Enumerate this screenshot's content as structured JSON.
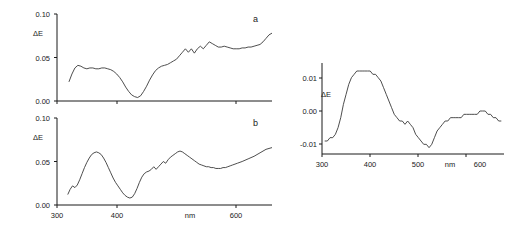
{
  "figure": {
    "background": "#ffffff",
    "line_color": "#3a3a3a",
    "axis_color": "#1a1a1a"
  },
  "panels": {
    "a": {
      "letter": "a",
      "y_axis_label": "ΔE",
      "x_axis_label": "nm",
      "y_ticks": [
        "0.10",
        "0.05",
        "0.00"
      ],
      "x_ticks": [
        "300",
        "400",
        "600"
      ]
    },
    "b": {
      "letter": "b",
      "y_axis_label": "ΔE",
      "x_axis_label": "nm",
      "y_ticks": [
        "0.10",
        "0.05",
        "0.00"
      ],
      "x_ticks": [
        "300",
        "400",
        "600"
      ]
    },
    "c": {
      "letter": "",
      "y_axis_label": "ΔE",
      "x_axis_label": "nm",
      "y_ticks": [
        "0.01",
        "0.00",
        "-0.01"
      ],
      "x_ticks": [
        "300",
        "400",
        "500",
        "600"
      ]
    }
  },
  "chart_data": [
    {
      "id": "panel-a",
      "type": "line",
      "title": "a",
      "xlabel": "nm",
      "ylabel": "ΔE",
      "xlim": [
        300,
        660
      ],
      "ylim": [
        0.0,
        0.1
      ],
      "xticks": [
        300,
        400,
        600
      ],
      "yticks": [
        0.0,
        0.05,
        0.1
      ],
      "grid": false,
      "legend": "none",
      "series": [
        {
          "name": "ΔE spectrum a",
          "x": [
            320,
            325,
            330,
            335,
            340,
            345,
            350,
            355,
            360,
            365,
            370,
            375,
            380,
            385,
            390,
            395,
            400,
            405,
            410,
            415,
            420,
            425,
            430,
            435,
            440,
            445,
            450,
            455,
            460,
            465,
            470,
            475,
            480,
            485,
            490,
            495,
            500,
            505,
            510,
            515,
            520,
            525,
            530,
            535,
            540,
            545,
            550,
            555,
            560,
            565,
            570,
            575,
            580,
            585,
            590,
            595,
            600,
            605,
            610,
            615,
            620,
            625,
            630,
            635,
            640,
            645,
            650,
            655,
            660
          ],
          "y": [
            0.022,
            0.031,
            0.038,
            0.041,
            0.04,
            0.038,
            0.037,
            0.038,
            0.038,
            0.037,
            0.037,
            0.038,
            0.038,
            0.037,
            0.036,
            0.034,
            0.031,
            0.027,
            0.022,
            0.016,
            0.011,
            0.007,
            0.005,
            0.004,
            0.006,
            0.011,
            0.017,
            0.024,
            0.03,
            0.035,
            0.038,
            0.04,
            0.041,
            0.042,
            0.044,
            0.046,
            0.048,
            0.052,
            0.056,
            0.06,
            0.056,
            0.06,
            0.055,
            0.06,
            0.063,
            0.06,
            0.064,
            0.068,
            0.066,
            0.064,
            0.062,
            0.062,
            0.063,
            0.062,
            0.061,
            0.06,
            0.06,
            0.06,
            0.061,
            0.061,
            0.062,
            0.062,
            0.063,
            0.064,
            0.065,
            0.068,
            0.072,
            0.076,
            0.078
          ]
        }
      ]
    },
    {
      "id": "panel-b",
      "type": "line",
      "title": "b",
      "xlabel": "nm",
      "ylabel": "ΔE",
      "xlim": [
        300,
        660
      ],
      "ylim": [
        0.0,
        0.1
      ],
      "xticks": [
        300,
        400,
        600
      ],
      "yticks": [
        0.0,
        0.05,
        0.1
      ],
      "grid": false,
      "legend": "none",
      "series": [
        {
          "name": "ΔE spectrum b",
          "x": [
            318,
            322,
            326,
            330,
            334,
            338,
            342,
            346,
            350,
            354,
            358,
            362,
            366,
            370,
            374,
            378,
            382,
            386,
            390,
            394,
            398,
            402,
            406,
            410,
            414,
            418,
            422,
            426,
            430,
            434,
            438,
            442,
            446,
            450,
            454,
            458,
            462,
            466,
            470,
            474,
            478,
            482,
            486,
            490,
            494,
            498,
            502,
            506,
            510,
            514,
            518,
            522,
            526,
            530,
            534,
            538,
            542,
            546,
            550,
            554,
            558,
            562,
            566,
            570,
            574,
            578,
            582,
            586,
            590,
            594,
            598,
            602,
            610,
            620,
            630,
            640,
            650,
            660
          ],
          "y": [
            0.012,
            0.018,
            0.022,
            0.02,
            0.023,
            0.029,
            0.036,
            0.043,
            0.049,
            0.054,
            0.058,
            0.06,
            0.061,
            0.06,
            0.058,
            0.054,
            0.049,
            0.043,
            0.037,
            0.031,
            0.026,
            0.022,
            0.018,
            0.014,
            0.011,
            0.009,
            0.008,
            0.009,
            0.013,
            0.019,
            0.026,
            0.032,
            0.036,
            0.038,
            0.039,
            0.041,
            0.044,
            0.041,
            0.044,
            0.047,
            0.05,
            0.048,
            0.052,
            0.055,
            0.057,
            0.059,
            0.061,
            0.062,
            0.061,
            0.059,
            0.057,
            0.055,
            0.053,
            0.051,
            0.049,
            0.047,
            0.046,
            0.045,
            0.044,
            0.044,
            0.043,
            0.043,
            0.042,
            0.042,
            0.042,
            0.043,
            0.043,
            0.044,
            0.045,
            0.046,
            0.047,
            0.048,
            0.05,
            0.053,
            0.056,
            0.06,
            0.064,
            0.066
          ]
        }
      ]
    },
    {
      "id": "panel-c",
      "type": "line",
      "title": "",
      "xlabel": "nm",
      "ylabel": "ΔE",
      "xlim": [
        300,
        640
      ],
      "ylim": [
        -0.015,
        0.015
      ],
      "xticks": [
        300,
        400,
        500,
        600
      ],
      "yticks": [
        -0.01,
        0.0,
        0.01
      ],
      "grid": false,
      "legend": "none",
      "series": [
        {
          "name": "ΔE spectrum c",
          "x": [
            305,
            310,
            315,
            320,
            325,
            330,
            335,
            340,
            345,
            350,
            355,
            360,
            365,
            370,
            375,
            380,
            385,
            390,
            395,
            400,
            405,
            410,
            415,
            420,
            425,
            430,
            435,
            440,
            445,
            450,
            455,
            460,
            465,
            470,
            475,
            480,
            485,
            490,
            495,
            500,
            505,
            510,
            515,
            520,
            525,
            530,
            535,
            540,
            545,
            550,
            555,
            560,
            565,
            570,
            575,
            580,
            585,
            590,
            595,
            600,
            605,
            610,
            615,
            620,
            625,
            630,
            635
          ],
          "y": [
            -0.009,
            -0.009,
            -0.008,
            -0.008,
            -0.007,
            -0.005,
            -0.002,
            0.002,
            0.005,
            0.008,
            0.01,
            0.011,
            0.012,
            0.012,
            0.012,
            0.012,
            0.012,
            0.012,
            0.011,
            0.011,
            0.01,
            0.009,
            0.007,
            0.005,
            0.003,
            0.001,
            -0.001,
            -0.002,
            -0.003,
            -0.003,
            -0.004,
            -0.003,
            -0.004,
            -0.005,
            -0.007,
            -0.008,
            -0.009,
            -0.01,
            -0.01,
            -0.011,
            -0.01,
            -0.008,
            -0.006,
            -0.005,
            -0.004,
            -0.003,
            -0.003,
            -0.002,
            -0.002,
            -0.002,
            -0.002,
            -0.002,
            -0.001,
            -0.001,
            -0.001,
            -0.001,
            -0.001,
            -0.001,
            0.0,
            0.0,
            0.0,
            -0.001,
            -0.001,
            -0.002,
            -0.002,
            -0.003,
            -0.003
          ]
        }
      ]
    }
  ]
}
